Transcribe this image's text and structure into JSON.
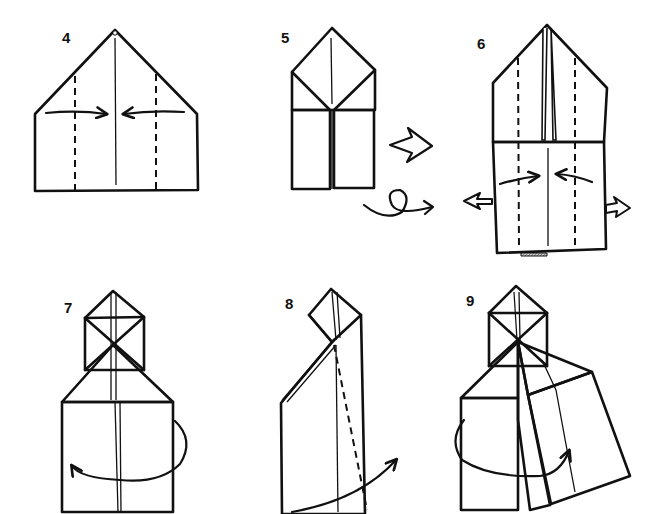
{
  "diagram": {
    "type": "origami-instructions",
    "paper_colors": {
      "colored_side": "#b9b9b9",
      "white_side": "#ffffff",
      "line": "#111111"
    },
    "steps": [
      {
        "number": "4",
        "description": "Fold both sides to the center along the valley lines"
      },
      {
        "number": "5",
        "description": "Result; turn the model over"
      },
      {
        "number": "6",
        "description": "Fold sides to center while pulling out the inside flaps"
      },
      {
        "number": "7",
        "description": "Fold right half behind to the left"
      },
      {
        "number": "8",
        "description": "Valley fold along dashed line and swing right"
      },
      {
        "number": "9",
        "description": "Swing the flap around to the front"
      }
    ],
    "symbols": {
      "next_step": "hollow-arrow",
      "turn_over": "loop-arrow",
      "pull_out": "hollow-arrows"
    }
  }
}
